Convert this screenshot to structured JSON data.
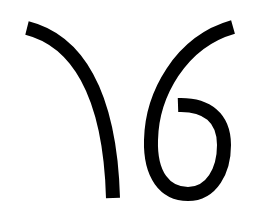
{
  "image": {
    "description": "Two black calligraphic strokes forming a stylized mark resembling '16'",
    "background_color": "#ffffff",
    "stroke_color": "#000000",
    "stroke_width": 14
  },
  "glyphs": [
    {
      "name": "left-stroke",
      "shape": "curve from top-left sweeping down to a vertical bottom end"
    },
    {
      "name": "right-stroke",
      "shape": "curve from top-right sweeping down-left into a loop ending with an inward hook"
    }
  ]
}
